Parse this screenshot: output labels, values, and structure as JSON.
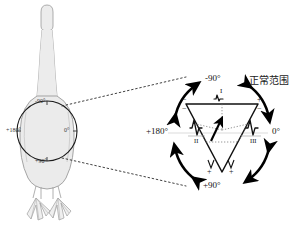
{
  "colors": {
    "body_outline": "#9a9a9a",
    "body_fill": "#ebebeb",
    "axis_circle": "#1a1a1a",
    "arrow": "#000000",
    "triangle": "#111111",
    "dotted_guide": "#2b2b2b",
    "grid": "#bbbbbb",
    "text": "#141414"
  },
  "bird_panel": {
    "name": "duck-dorsal-outline",
    "axis_circle_labels": {
      "top": "-90°",
      "right": "0°",
      "bottom": "+90°",
      "left": "+180°"
    }
  },
  "axis_panel": {
    "angle_labels": {
      "top": "-90°",
      "right": "0°",
      "bottom": "+90°",
      "left": "+180°"
    },
    "normal_range_label": "正常范围",
    "lead_labels": {
      "lead_1": "I",
      "lead_2": "II",
      "lead_3": "III"
    },
    "polarity_marks": [
      {
        "position": "top-left",
        "sign": "−"
      },
      {
        "position": "top-right",
        "sign": "+"
      },
      {
        "position": "left-inner",
        "sign": "−"
      },
      {
        "position": "right-inner",
        "sign": "−"
      },
      {
        "position": "bottom-left",
        "sign": "+"
      },
      {
        "position": "bottom-right",
        "sign": "+"
      }
    ],
    "arcs": [
      {
        "name": "arc-upper-left",
        "direction": "counterclockwise"
      },
      {
        "name": "arc-upper-right",
        "direction": "clockwise"
      },
      {
        "name": "arc-lower-left",
        "direction": "clockwise"
      },
      {
        "name": "arc-lower-right",
        "direction": "counterclockwise"
      }
    ]
  }
}
